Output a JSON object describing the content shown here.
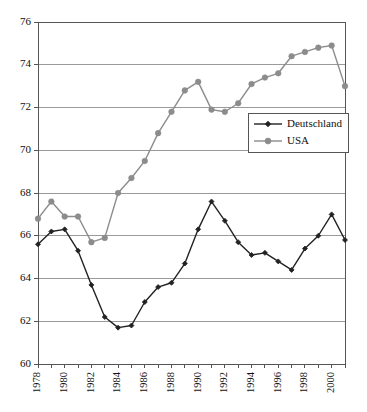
{
  "chart_data": {
    "type": "line",
    "title": "",
    "xlabel": "",
    "ylabel": "",
    "x": [
      1978,
      1979,
      1980,
      1981,
      1982,
      1983,
      1984,
      1985,
      1986,
      1987,
      1988,
      1989,
      1990,
      1991,
      1992,
      1993,
      1994,
      1995,
      1996,
      1997,
      1998,
      1999,
      2000,
      2001
    ],
    "xlim": [
      1978,
      2001
    ],
    "ylim": [
      60,
      76
    ],
    "ytick_values": [
      60,
      62,
      64,
      66,
      68,
      70,
      72,
      74,
      76
    ],
    "ytick_labels": [
      "60",
      "62",
      "64",
      "66",
      "68",
      "70",
      "72",
      "74",
      "76"
    ],
    "xtick_labels": [
      "1978",
      "1980",
      "1982",
      "1984",
      "1986",
      "1988",
      "1990",
      "1992",
      "1994",
      "1996",
      "1998",
      "2000"
    ],
    "xtick_label_years": [
      1978,
      1980,
      1982,
      1984,
      1986,
      1988,
      1990,
      1992,
      1994,
      1996,
      1998,
      2000
    ],
    "grid": "horizontal",
    "legend_position": "inner-right",
    "series": [
      {
        "name": "Deutschland",
        "color": "#222222",
        "marker": "diamond",
        "values": [
          65.6,
          66.2,
          66.3,
          65.3,
          63.7,
          62.2,
          61.7,
          61.8,
          62.9,
          63.6,
          63.8,
          64.7,
          66.3,
          67.6,
          66.7,
          65.7,
          65.1,
          65.2,
          64.8,
          64.4,
          65.4,
          66.0,
          67.0,
          65.8
        ]
      },
      {
        "name": "USA",
        "color": "#8c8c8c",
        "marker": "circle",
        "values": [
          66.8,
          67.6,
          66.9,
          66.9,
          65.7,
          65.9,
          68.0,
          68.7,
          69.5,
          70.8,
          71.8,
          72.8,
          73.2,
          71.9,
          71.8,
          72.2,
          73.1,
          73.4,
          73.6,
          74.4,
          74.6,
          74.8,
          74.9,
          73.0
        ]
      }
    ]
  },
  "legend": {
    "items": [
      {
        "label": "Deutschland"
      },
      {
        "label": "USA"
      }
    ]
  },
  "colors": {
    "deutschland": "#222222",
    "usa": "#8c8c8c",
    "gridline": "#9a9a9a",
    "axis": "#555555",
    "background": "#ffffff"
  }
}
